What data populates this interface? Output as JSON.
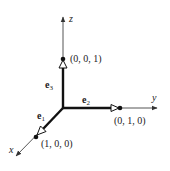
{
  "diagram": {
    "axes": {
      "x": {
        "label": "x"
      },
      "y": {
        "label": "y"
      },
      "z": {
        "label": "z"
      }
    },
    "vectors": [
      {
        "name": "e",
        "subscript": "1",
        "point": "(1, 0, 0)"
      },
      {
        "name": "e",
        "subscript": "2",
        "point": "(0, 1, 0)"
      },
      {
        "name": "e",
        "subscript": "3",
        "point": "(0, 0, 1)"
      }
    ],
    "colors": {
      "axis": "#444444",
      "vector": "#111111",
      "text": "#222222"
    }
  }
}
